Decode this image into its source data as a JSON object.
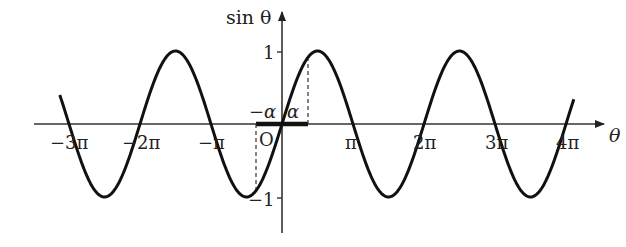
{
  "chart_data": {
    "type": "line",
    "title": "",
    "function": "sin θ",
    "xlabel": "θ",
    "ylabel": "sin θ",
    "x_range_radians_over_pi": [
      -3.13,
      4.11
    ],
    "ylim": [
      -1,
      1
    ],
    "x_ticks": [
      "−3π",
      "−2π",
      "−π",
      "π",
      "2π",
      "3π",
      "4π"
    ],
    "x_tick_values_over_pi": [
      -3,
      -2,
      -1,
      1,
      2,
      3,
      4
    ],
    "y_ticks": [
      "1",
      "−1"
    ],
    "y_tick_values": [
      1,
      -1
    ],
    "origin_label": "O",
    "annotations": [
      {
        "text": "−α",
        "at": "-alpha"
      },
      {
        "text": "α",
        "at": "alpha"
      }
    ],
    "highlighted_interval": [
      "−α",
      "α"
    ],
    "dashed_lines": [
      {
        "x": "−α",
        "to": "sin(−α)"
      },
      {
        "x": "α",
        "to": "sin(α)"
      }
    ],
    "series": [
      {
        "name": "sin θ",
        "color": "#111111"
      }
    ],
    "grid": false,
    "legend": null
  },
  "labels": {
    "y_axis": "sin θ",
    "x_axis": "θ",
    "origin": "O",
    "neg_alpha": "−α",
    "alpha": "α",
    "y_one": "1",
    "y_neg_one": "−1",
    "x_m3pi": "−3π",
    "x_m2pi": "−2π",
    "x_mpi": "−π",
    "x_pi": "π",
    "x_2pi": "2π",
    "x_3pi": "3π",
    "x_4pi": "4π"
  }
}
